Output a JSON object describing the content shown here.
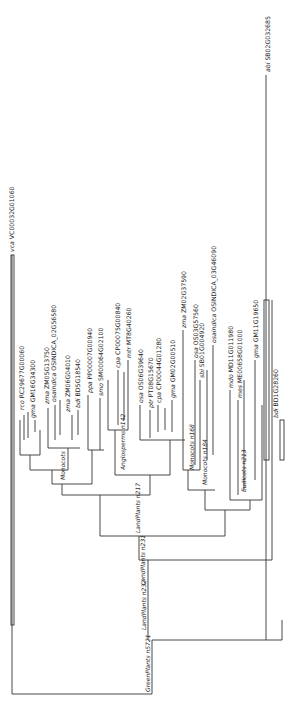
{
  "figure": {
    "type": "phylogenetic-tree",
    "orientation": "rotated-90-ccw",
    "root_label": "GreenPlants n5721"
  },
  "internal_nodes": [
    {
      "id": "greenplants",
      "label": "GreenPlants n5721"
    },
    {
      "id": "landplants232",
      "label": "LandPlants n232"
    },
    {
      "id": "landplants231",
      "label": "LandPlants n231"
    },
    {
      "id": "landplants217",
      "label": "LandPlants n217"
    },
    {
      "id": "angiosperms",
      "label": "Angiosperms n142"
    },
    {
      "id": "monocots1",
      "label": "Monocots n168"
    },
    {
      "id": "monocots2",
      "label": "Monocots n184"
    },
    {
      "id": "eudicots",
      "label": "Eudicots n213"
    },
    {
      "id": "monocots3",
      "label": "Monocots"
    }
  ],
  "leaves": [
    {
      "sp": "vca",
      "id": "VC00032G01060"
    },
    {
      "sp": "abi",
      "id": "SB02G032685"
    },
    {
      "sp": "rco",
      "id": "RC29677G00060"
    },
    {
      "sp": "gma",
      "id": "GM16G34300"
    },
    {
      "sp": "zma",
      "id": "ZM05G13750"
    },
    {
      "sp": "osaindica",
      "id": "OSINDICA_02G56580"
    },
    {
      "sp": "zma",
      "id": "ZM06G04010"
    },
    {
      "sp": "bdi",
      "id": "BD5G18540"
    },
    {
      "sp": "ppa",
      "id": "PP00007G00940"
    },
    {
      "sp": "smo",
      "id": "SM00064G02100"
    },
    {
      "sp": "cpa",
      "id": "CP00075G00840"
    },
    {
      "sp": "mtr",
      "id": "MT8G40260"
    },
    {
      "sp": "osa",
      "id": "OS06G39640"
    },
    {
      "sp": "ptr",
      "id": "PT08G15670"
    },
    {
      "sp": "cpa",
      "id": "CP00044G01280"
    },
    {
      "sp": "gma",
      "id": "GM02G00510"
    },
    {
      "sp": "zma",
      "id": "ZM02G37590"
    },
    {
      "sp": "osa",
      "id": "OS03G57560"
    },
    {
      "sp": "sbi",
      "id": "SB01G004920"
    },
    {
      "sp": "osaindica",
      "id": "OSINDICA_03G46090"
    },
    {
      "sp": "mdo",
      "id": "MD11G011980"
    },
    {
      "sp": "mes",
      "id": "ME00658G01000"
    },
    {
      "sp": "gma",
      "id": "GM11G19650"
    },
    {
      "sp": "bdi",
      "id": "BD1G28260"
    }
  ]
}
